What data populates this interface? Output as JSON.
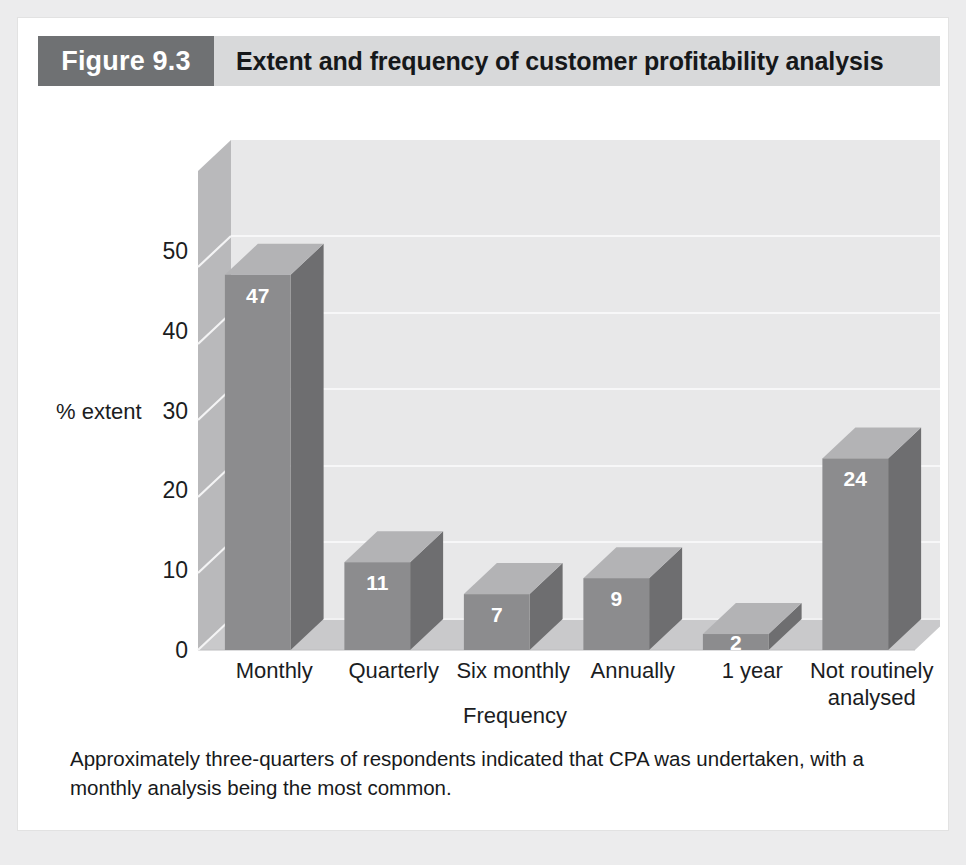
{
  "figure": {
    "number_label": "Figure 9.3",
    "title": "Extent and frequency of customer profitability analysis",
    "caption_line1": "Approximately three-quarters of respondents indicated that CPA was undertaken, with a",
    "caption_line2": "monthly analysis being the most common.",
    "header_block_color": "#6f7173",
    "header_band_color": "#d8d9da",
    "panel_color": "#ffffff",
    "page_color": "#ececed"
  },
  "chart_data": {
    "type": "bar",
    "title": "Extent and frequency of customer profitability analysis",
    "categories": [
      "Monthly",
      "Quarterly",
      "Six monthly",
      "Annually",
      "1 year",
      "Not routinely analysed"
    ],
    "values": [
      47,
      11,
      7,
      9,
      2,
      24
    ],
    "value_labels": [
      "47",
      "11",
      "7",
      "9",
      "2",
      "24"
    ],
    "xlabel": "Frequency",
    "ylabel": "% extent",
    "ylim": [
      0,
      60
    ],
    "yticks": [
      0,
      10,
      20,
      30,
      40,
      50
    ],
    "ytick_labels": [
      "0",
      "10",
      "20",
      "30",
      "40",
      "50"
    ],
    "grid": true,
    "legend": "none",
    "three_d": true,
    "colors": {
      "bar_front": "#8c8c8e",
      "bar_side": "#6e6e70",
      "bar_top": "#b3b3b5",
      "back_wall": "#e8e8e9",
      "side_wall": "#b9b9bb",
      "floor": "#c9c9cb",
      "gridline": "#f7f7f8",
      "value_text": "#ffffff",
      "axis_text": "#1b1d1f"
    }
  },
  "axis": {
    "x_title": "Frequency",
    "y_title": "% extent",
    "category_label_lines": [
      [
        "Monthly"
      ],
      [
        "Quarterly"
      ],
      [
        "Six monthly"
      ],
      [
        "Annually"
      ],
      [
        "1 year"
      ],
      [
        "Not routinely",
        "analysed"
      ]
    ]
  }
}
